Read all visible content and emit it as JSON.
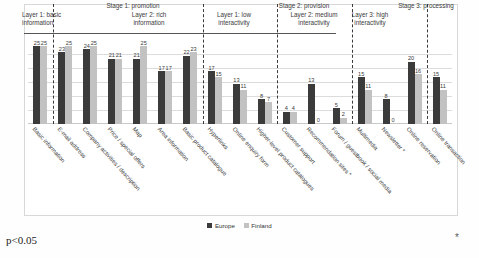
{
  "chart_data": {
    "type": "bar",
    "title": "",
    "subtitle": "",
    "xlabel": "",
    "ylabel": "",
    "ylim": [
      0,
      27
    ],
    "grid": true,
    "legend_position": "bottom",
    "categories": [
      "Basic information",
      "E-mail address",
      "Company activities / description",
      "Price / special offers",
      "Map",
      "Area information",
      "Basic product catalogue",
      "Hyperlinks",
      "Online enquiry form",
      "Higher-level product catalogues",
      "Customer support",
      "Recommendation sites *",
      "Forum / guestbook / social media",
      "Multimedia",
      "Newsletter *",
      "Online reservation",
      "Online transaction"
    ],
    "series": [
      {
        "name": "Europe",
        "color": "#3b3b3b",
        "values": [
          25,
          23,
          24,
          21,
          21,
          17,
          22,
          17,
          13,
          8,
          4,
          13,
          5,
          15,
          8,
          20,
          15
        ]
      },
      {
        "name": "Finland",
        "color": "#c2c2c2",
        "values": [
          25,
          25,
          25,
          21,
          25,
          17,
          23,
          15,
          11,
          7,
          4,
          0,
          2,
          11,
          0,
          16,
          11
        ]
      }
    ],
    "annotations": {
      "p_value": "p<0.05",
      "significance_marker": "*"
    }
  },
  "header": {
    "stages": [
      {
        "label": "Stage 1: promotion"
      },
      {
        "label": "Stage 2: provision"
      },
      {
        "label": "Stage 3: processing"
      }
    ],
    "layers": [
      {
        "label_line1": "Layer 1: basic",
        "label_line2": "information"
      },
      {
        "label_line1": "Layer 2: rich",
        "label_line2": "information"
      },
      {
        "label_line1": "Layer 1: low",
        "label_line2": "interactivity"
      },
      {
        "label_line1": "Layer 2: medium",
        "label_line2": "interactivity"
      },
      {
        "label_line1": "Layer 3: high",
        "label_line2": "interactivity"
      }
    ]
  },
  "legend": {
    "items": [
      {
        "label": "Europe"
      },
      {
        "label": "Finland"
      }
    ]
  }
}
